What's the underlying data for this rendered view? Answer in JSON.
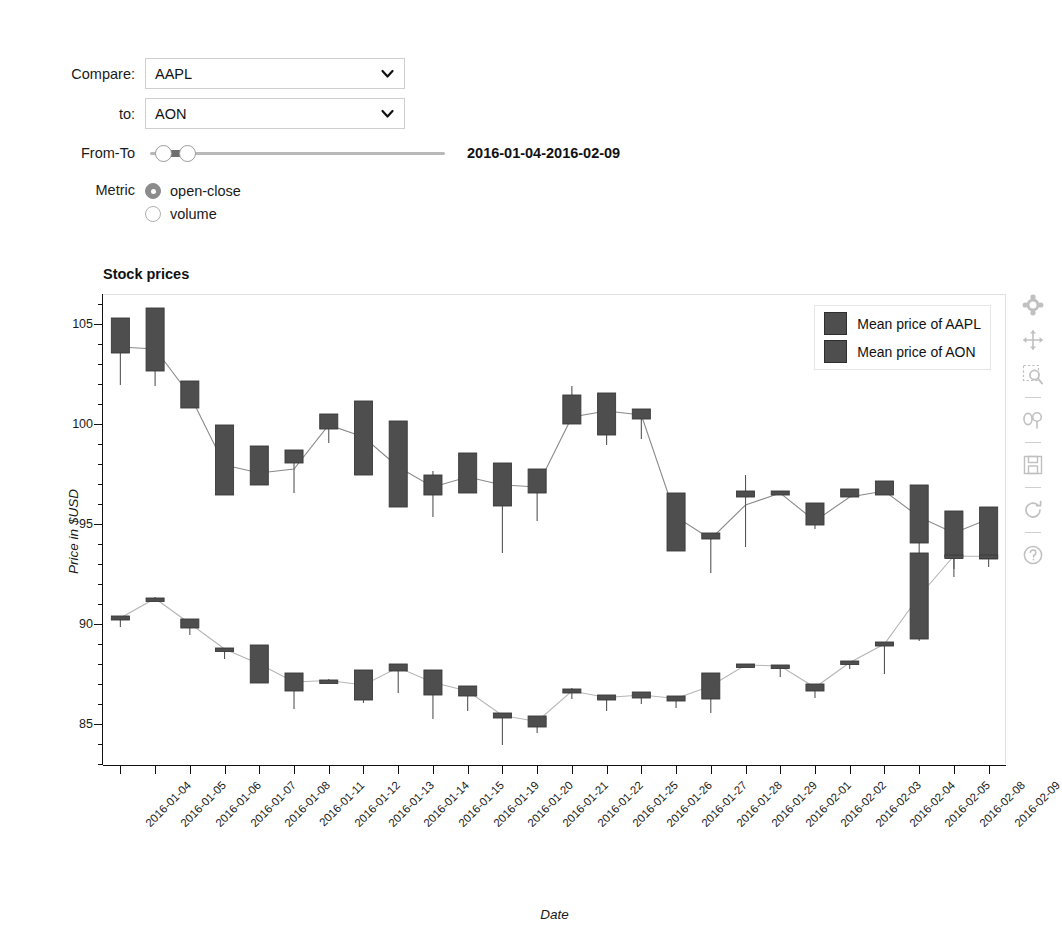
{
  "controls": {
    "compare": {
      "label": "Compare:",
      "value": "AAPL",
      "icon": "chevron-down-icon"
    },
    "to": {
      "label": "to:",
      "value": "AON",
      "icon": "chevron-down-icon"
    },
    "range": {
      "label": "From-To",
      "value": "2016-01-04-2016-02-09"
    },
    "metric": {
      "label": "Metric",
      "selected": "open-close",
      "options": [
        {
          "label": "open-close",
          "checked": true
        },
        {
          "label": "volume",
          "checked": false
        }
      ]
    }
  },
  "plot": {
    "title": "Stock prices",
    "legend": [
      {
        "label": "Mean price of AAPL",
        "color": "#4e4e4e"
      },
      {
        "label": "Mean price of AON",
        "color": "#4e4e4e"
      }
    ],
    "toolbar": [
      "bokeh-logo-icon",
      "pan-move-icon",
      "box-zoom-icon",
      "wheel-zoom-icon",
      "save-icon",
      "reset-icon",
      "help-icon"
    ]
  },
  "chart_data": {
    "type": "bar",
    "title": "Stock prices",
    "xlabel": "Date",
    "ylabel": "Price in $USD",
    "ylim": [
      83,
      106.5
    ],
    "yticks": [
      85,
      90,
      95,
      100,
      105
    ],
    "grid": false,
    "legend_position": "top-right",
    "categories": [
      "2016-01-04",
      "2016-01-05",
      "2016-01-06",
      "2016-01-07",
      "2016-01-08",
      "2016-01-11",
      "2016-01-12",
      "2016-01-13",
      "2016-01-14",
      "2016-01-15",
      "2016-01-19",
      "2016-01-20",
      "2016-01-21",
      "2016-01-22",
      "2016-01-25",
      "2016-01-26",
      "2016-01-27",
      "2016-01-28",
      "2016-01-29",
      "2016-02-01",
      "2016-02-02",
      "2016-02-03",
      "2016-02-04",
      "2016-02-05",
      "2016-02-08",
      "2016-02-09"
    ],
    "series": [
      {
        "name": "Mean price of AAPL",
        "type": "candlestick",
        "color": "#4e4e4e",
        "open": [
          105.35,
          105.85,
          102.2,
          100.0,
          98.95,
          98.75,
          100.55,
          101.2,
          100.2,
          97.5,
          98.6,
          98.1,
          97.8,
          101.5,
          101.6,
          100.8,
          96.6,
          94.6,
          96.7,
          96.7,
          96.1,
          96.8,
          97.2,
          97.0,
          95.7,
          95.9
        ],
        "close": [
          103.6,
          102.7,
          100.85,
          96.5,
          97.0,
          98.1,
          99.8,
          97.5,
          95.9,
          96.5,
          96.6,
          95.95,
          96.6,
          100.05,
          99.5,
          100.3,
          93.7,
          94.3,
          96.4,
          96.5,
          95.0,
          96.4,
          96.5,
          94.1,
          93.4,
          93.3
        ],
        "high": [
          105.35,
          105.85,
          102.2,
          100.0,
          98.95,
          98.75,
          100.55,
          101.2,
          100.2,
          97.7,
          98.6,
          98.1,
          97.8,
          101.95,
          101.6,
          100.8,
          96.6,
          94.6,
          97.5,
          96.7,
          96.1,
          96.8,
          97.2,
          97.0,
          95.7,
          95.9
        ],
        "low": [
          102.0,
          101.95,
          100.85,
          96.5,
          97.0,
          96.6,
          99.1,
          97.5,
          95.9,
          95.4,
          96.6,
          93.6,
          95.2,
          100.05,
          99.0,
          99.3,
          93.7,
          92.6,
          93.9,
          96.5,
          94.8,
          96.4,
          96.5,
          93.0,
          92.8,
          93.3
        ],
        "mean": [
          103.9,
          103.8,
          101.5,
          98.0,
          97.6,
          97.8,
          100.0,
          99.4,
          97.9,
          96.9,
          97.4,
          97.0,
          96.9,
          100.4,
          100.7,
          100.5,
          95.4,
          94.3,
          96.0,
          96.6,
          95.2,
          96.4,
          96.7,
          95.4,
          94.6,
          95.3
        ]
      },
      {
        "name": "Mean price of AON",
        "type": "candlestick",
        "color": "#4e4e4e",
        "open": [
          90.45,
          91.35,
          90.3,
          88.85,
          89.0,
          87.6,
          87.25,
          87.75,
          88.05,
          87.75,
          86.95,
          85.6,
          85.45,
          86.8,
          86.5,
          86.65,
          86.45,
          87.6,
          88.05,
          88.0,
          87.05,
          88.2,
          89.15,
          93.6,
          93.5,
          93.5
        ],
        "close": [
          90.25,
          91.3,
          89.85,
          88.75,
          87.1,
          86.7,
          87.2,
          86.25,
          87.7,
          86.5,
          86.45,
          85.35,
          84.9,
          86.6,
          86.25,
          86.35,
          86.2,
          86.3,
          87.95,
          87.9,
          86.7,
          88.05,
          88.95,
          89.3,
          93.4,
          93.35
        ],
        "high": [
          90.45,
          91.4,
          90.3,
          88.85,
          89.0,
          87.6,
          87.3,
          87.75,
          88.05,
          87.75,
          86.95,
          85.6,
          85.45,
          86.85,
          86.5,
          86.65,
          86.45,
          87.6,
          88.05,
          88.0,
          87.05,
          88.2,
          89.15,
          93.6,
          93.55,
          93.5
        ],
        "low": [
          89.9,
          91.3,
          89.5,
          88.3,
          87.1,
          85.8,
          87.15,
          86.1,
          86.6,
          85.3,
          85.7,
          84.0,
          84.6,
          86.3,
          85.7,
          86.05,
          85.85,
          85.6,
          87.9,
          87.4,
          86.35,
          87.8,
          87.55,
          89.2,
          92.4,
          92.9
        ]
      }
    ]
  }
}
